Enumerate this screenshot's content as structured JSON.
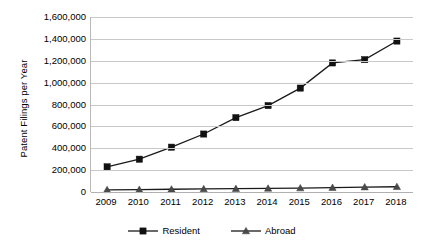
{
  "chart_data": {
    "type": "line",
    "title": "",
    "xlabel": "",
    "ylabel": "Patent Filings per Year",
    "categories": [
      "2009",
      "2010",
      "2011",
      "2012",
      "2013",
      "2014",
      "2015",
      "2016",
      "2017",
      "2018"
    ],
    "x": [
      2009,
      2010,
      2011,
      2012,
      2013,
      2014,
      2015,
      2016,
      2017,
      2018
    ],
    "series": [
      {
        "name": "Resident",
        "marker": "square",
        "values": [
          230000,
          300000,
          410000,
          530000,
          680000,
          790000,
          950000,
          1180000,
          1210000,
          1380000
        ]
      },
      {
        "name": "Abroad",
        "marker": "triangle",
        "values": [
          20000,
          22000,
          25000,
          28000,
          30000,
          33000,
          36000,
          40000,
          45000,
          48000
        ]
      }
    ],
    "ylim": [
      0,
      1600000
    ],
    "ytick_values": [
      0,
      200000,
      400000,
      600000,
      800000,
      1000000,
      1200000,
      1400000,
      1600000
    ],
    "ytick_labels": [
      "0",
      "200,000",
      "400,000",
      "600,000",
      "800,000",
      "1,000,000",
      "1,200,000",
      "1,400,000",
      "1,600,000"
    ],
    "grid": true,
    "legend_position": "bottom",
    "colors": {
      "resident": "#111111",
      "abroad": "#4a4a4a",
      "gridline": "#c9c9c9",
      "axis": "#b0b0b0",
      "background": "#ffffff"
    }
  },
  "legend": {
    "items": [
      {
        "label": "Resident"
      },
      {
        "label": "Abroad"
      }
    ]
  }
}
